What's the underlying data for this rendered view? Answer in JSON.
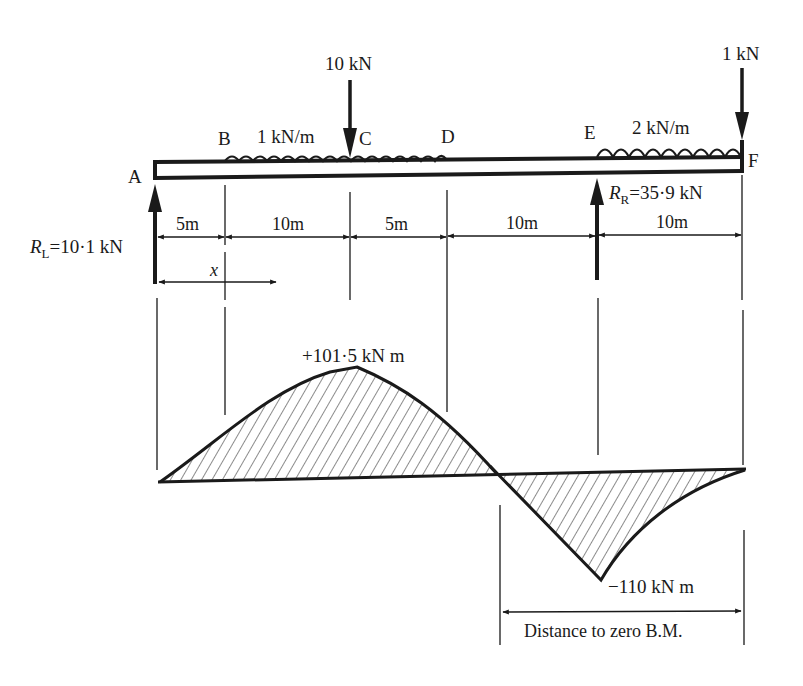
{
  "diagram": {
    "type": "beam-bending-moment-diagram",
    "colors": {
      "ink": "#1a1a1a",
      "background": "#ffffff"
    },
    "points": [
      {
        "id": "A",
        "label": "A",
        "x_m": 0
      },
      {
        "id": "B",
        "label": "B",
        "x_m": 5
      },
      {
        "id": "C",
        "label": "C",
        "x_m": 15
      },
      {
        "id": "D",
        "label": "D",
        "x_m": 20
      },
      {
        "id": "E",
        "label": "E",
        "x_m": 30
      },
      {
        "id": "F",
        "label": "F",
        "x_m": 40
      }
    ],
    "loads": {
      "point_load_C": "10 kN",
      "point_load_F": "1 kN",
      "udl_BD": "1 kN/m",
      "udl_EF": "2 kN/m"
    },
    "reactions": {
      "left": {
        "symbol": "R",
        "subscript": "L",
        "value": "=10·1 kN"
      },
      "right": {
        "symbol": "R",
        "subscript": "R",
        "value": "=35·9 kN"
      }
    },
    "dimensions": [
      "5m",
      "10m",
      "5m",
      "10m",
      "10m"
    ],
    "x_variable": "x",
    "bending_moment": {
      "max_label": "+101·5 kN m",
      "min_label": "−110 kN m",
      "distance_label": "Distance to zero B.M."
    }
  }
}
